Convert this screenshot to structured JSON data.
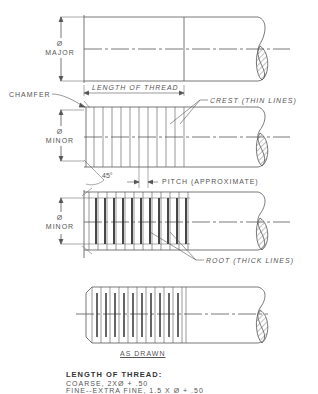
{
  "figure": {
    "views": [
      {
        "id": "major",
        "dim_label_symbol": "Ø",
        "dim_label": "MAJOR"
      },
      {
        "id": "crest",
        "dim_label_symbol": "Ø",
        "dim_label": "MINOR"
      },
      {
        "id": "root",
        "dim_label_symbol": "Ø",
        "dim_label": "MINOR"
      },
      {
        "id": "as_drawn",
        "caption": "AS DRAWN"
      }
    ],
    "labels": {
      "chamfer": "CHAMFER",
      "length_of_thread": "LENGTH OF THREAD",
      "crest": "CREST (THIN LINES)",
      "angle": "45°",
      "pitch": "PITCH (APPROXIMATE)",
      "root": "ROOT (THICK LINES)",
      "as_drawn": "AS DRAWN"
    },
    "notes": {
      "heading": "LENGTH OF THREAD:",
      "coarse": "COARSE, 2XØ + .50",
      "fine": "FINE--EXTRA FINE, 1.5 X Ø + .50"
    },
    "colors": {
      "line": "#555555",
      "text": "#555555",
      "background": "#ffffff"
    }
  }
}
